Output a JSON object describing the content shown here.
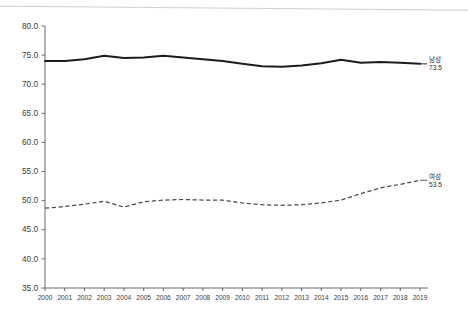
{
  "chart_data": {
    "type": "line",
    "title": "",
    "subtitle": "",
    "xlabel": "",
    "ylabel": "",
    "ylim": [
      35.0,
      80.0
    ],
    "ytick_step": 5.0,
    "ytick_labels": [
      "80.0",
      "75.0",
      "70.0",
      "65.0",
      "60.0",
      "55.0",
      "50.0",
      "45.0",
      "40.0",
      "35.0"
    ],
    "ytick_values": [
      80.0,
      75.0,
      70.0,
      65.0,
      60.0,
      55.0,
      50.0,
      45.0,
      40.0,
      35.0
    ],
    "grid": false,
    "legend_position": "end-of-line",
    "categories": [
      "2000",
      "2001",
      "2002",
      "2003",
      "2004",
      "2005",
      "2006",
      "2007",
      "2008",
      "2009",
      "2010",
      "2011",
      "2012",
      "2013",
      "2014",
      "2015",
      "2016",
      "2017",
      "2018",
      "2019"
    ],
    "series": [
      {
        "name": "남성",
        "style": "solid",
        "color": "#1c1c1c",
        "end_label": "남성",
        "end_value": "73.5",
        "values": [
          74.0,
          74.0,
          74.3,
          74.9,
          74.5,
          74.6,
          74.9,
          74.6,
          74.3,
          74.0,
          73.5,
          73.1,
          73.0,
          73.2,
          73.6,
          74.2,
          73.7,
          73.8,
          73.7,
          73.5
        ]
      },
      {
        "name": "여성",
        "style": "dashed",
        "color": "#4a4a4a",
        "end_label": "여성",
        "end_value": "53.5",
        "values": [
          48.7,
          49.0,
          49.4,
          49.9,
          48.9,
          49.8,
          50.1,
          50.2,
          50.1,
          50.1,
          49.6,
          49.3,
          49.2,
          49.3,
          49.6,
          50.1,
          51.2,
          52.2,
          52.8,
          53.5
        ]
      }
    ]
  }
}
